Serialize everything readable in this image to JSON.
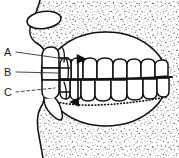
{
  "figure": {
    "caption": "",
    "background_color": "#ffffff",
    "ink_color": "#111111",
    "stipple_color": "#3a3a3a",
    "width": 179,
    "height": 158
  },
  "labels": [
    {
      "id": "A",
      "text": "A",
      "x": 4,
      "y": 47,
      "leader": "solid",
      "points_to": "upper-posterior-tooth"
    },
    {
      "id": "B",
      "text": "B",
      "x": 4,
      "y": 67,
      "leader": "solid",
      "points_to": "occlusal-contact-region"
    },
    {
      "id": "C",
      "text": "C",
      "x": 4,
      "y": 87,
      "leader": "dashed",
      "points_to": "lower-posterior-tooth"
    }
  ],
  "annotations": {
    "vertical_arrow": {
      "name": "interarch-distance-arrow",
      "style": "double-headed",
      "x": 78,
      "y_top": 58,
      "y_bottom": 103
    }
  },
  "parts": [
    {
      "name": "facial-profile-outline",
      "kind": "outline"
    },
    {
      "name": "nostril-oval",
      "kind": "outline"
    },
    {
      "name": "mouth-opening-oval",
      "kind": "outline"
    },
    {
      "name": "upper-gingival-dotted-line",
      "kind": "dotted"
    },
    {
      "name": "lower-gingival-dotted-line",
      "kind": "dotted"
    },
    {
      "name": "upper-dental-arch",
      "kind": "teeth-row",
      "tooth_count": 8
    },
    {
      "name": "lower-dental-arch",
      "kind": "teeth-row",
      "tooth_count": 8
    },
    {
      "name": "left-posterior-teeth-column",
      "kind": "teeth-column",
      "tooth_count": 4
    },
    {
      "name": "occlusal-plane-line",
      "kind": "line"
    },
    {
      "name": "background-stipple",
      "kind": "texture"
    }
  ]
}
